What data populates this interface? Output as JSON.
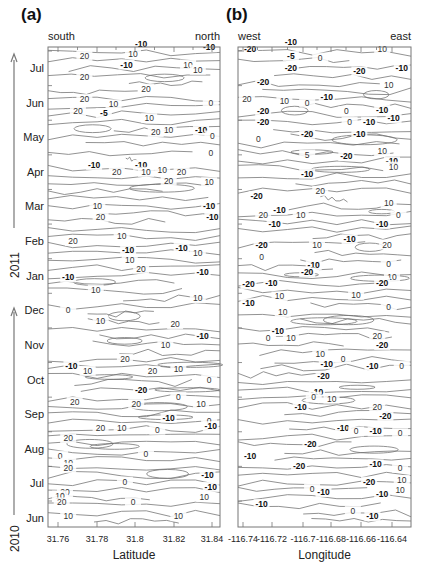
{
  "chart_data": [
    {
      "type": "contour",
      "panel_label": "(a)",
      "title": "",
      "xlabel": "Latitude",
      "ylabel": "",
      "x_direction_labels": {
        "left": "south",
        "right": "north"
      },
      "x_ticks": [
        "31.76",
        "31.78",
        "31.8",
        "31.82",
        "31.84"
      ],
      "xlim": [
        31.755,
        31.845
      ],
      "y_ticks": [
        "Jun",
        "Jul",
        "Aug",
        "Sep",
        "Oct",
        "Nov",
        "Dec",
        "Jan",
        "Feb",
        "Mar",
        "Apr",
        "May",
        "Jun",
        "Jul"
      ],
      "y_year_labels": [
        {
          "year": "2010",
          "months": "Jun–Dec"
        },
        {
          "year": "2011",
          "months": "Jan–Jul"
        }
      ],
      "contour_levels": [
        -20,
        -10,
        -5,
        0,
        5,
        10,
        20
      ],
      "grid": false,
      "contour_labels": [
        {
          "month_pos": 13.7,
          "x": 0.55,
          "v": "-10"
        },
        {
          "month_pos": 13.35,
          "x": 0.2,
          "v": "20"
        },
        {
          "month_pos": 13.4,
          "x": 0.5,
          "v": "10"
        },
        {
          "month_pos": 13.1,
          "x": 0.46,
          "v": "-10"
        },
        {
          "month_pos": 13.1,
          "x": 0.84,
          "v": "10"
        },
        {
          "month_pos": 12.95,
          "x": 0.9,
          "v": "10"
        },
        {
          "month_pos": 13.6,
          "x": 0.97,
          "v": "-10"
        },
        {
          "month_pos": 12.75,
          "x": 0.2,
          "v": "20"
        },
        {
          "month_pos": 12.4,
          "x": 0.58,
          "v": "20"
        },
        {
          "month_pos": 12.1,
          "x": 0.2,
          "v": "20"
        },
        {
          "month_pos": 11.95,
          "x": 0.38,
          "v": "10"
        },
        {
          "month_pos": 12.0,
          "x": 0.98,
          "v": "0"
        },
        {
          "month_pos": 11.75,
          "x": 0.16,
          "v": "20"
        },
        {
          "month_pos": 11.7,
          "x": 0.32,
          "v": "-5"
        },
        {
          "month_pos": 11.55,
          "x": 0.6,
          "v": "10"
        },
        {
          "month_pos": 11.15,
          "x": 0.64,
          "v": "20"
        },
        {
          "month_pos": 11.2,
          "x": 0.72,
          "v": "10"
        },
        {
          "month_pos": 11.2,
          "x": 0.92,
          "v": "-10"
        },
        {
          "month_pos": 11.05,
          "x": 0.99,
          "v": "0"
        },
        {
          "month_pos": 10.55,
          "x": 0.98,
          "v": "0"
        },
        {
          "month_pos": 10.2,
          "x": 0.26,
          "v": "-10"
        },
        {
          "month_pos": 10.2,
          "x": 0.55,
          "v": "-10"
        },
        {
          "month_pos": 10.0,
          "x": 0.4,
          "v": "20"
        },
        {
          "month_pos": 10.0,
          "x": 0.58,
          "v": "10"
        },
        {
          "month_pos": 10.05,
          "x": 0.68,
          "v": "10"
        },
        {
          "month_pos": 10.0,
          "x": 0.8,
          "v": "20"
        },
        {
          "month_pos": 9.75,
          "x": 0.72,
          "v": "20"
        },
        {
          "month_pos": 9.7,
          "x": 0.97,
          "v": "10"
        },
        {
          "month_pos": 9.0,
          "x": 0.28,
          "v": "10"
        },
        {
          "month_pos": 8.7,
          "x": 0.3,
          "v": "20"
        },
        {
          "month_pos": 9.0,
          "x": 0.97,
          "v": "-10"
        },
        {
          "month_pos": 8.7,
          "x": 0.99,
          "v": "-10"
        },
        {
          "month_pos": 8.0,
          "x": 0.13,
          "v": "20"
        },
        {
          "month_pos": 8.15,
          "x": 0.43,
          "v": "10"
        },
        {
          "month_pos": 7.75,
          "x": 0.47,
          "v": "-10"
        },
        {
          "month_pos": 7.8,
          "x": 0.8,
          "v": "-10"
        },
        {
          "month_pos": 7.65,
          "x": 0.9,
          "v": "10"
        },
        {
          "month_pos": 7.45,
          "x": 0.48,
          "v": "10"
        },
        {
          "month_pos": 6.95,
          "x": 0.1,
          "v": "-10"
        },
        {
          "month_pos": 7.2,
          "x": 0.55,
          "v": "20"
        },
        {
          "month_pos": 7.1,
          "x": 0.93,
          "v": "-10"
        },
        {
          "month_pos": 6.6,
          "x": 0.27,
          "v": "10"
        },
        {
          "month_pos": 6.0,
          "x": 0.1,
          "v": "0"
        },
        {
          "month_pos": 6.35,
          "x": 0.9,
          "v": "10"
        },
        {
          "month_pos": 5.7,
          "x": 0.3,
          "v": "10"
        },
        {
          "month_pos": 5.6,
          "x": 0.76,
          "v": "20"
        },
        {
          "month_pos": 5.25,
          "x": 0.93,
          "v": "-10"
        },
        {
          "month_pos": 5.0,
          "x": 0.7,
          "v": "10"
        },
        {
          "month_pos": 4.6,
          "x": 0.45,
          "v": "20"
        },
        {
          "month_pos": 4.4,
          "x": 0.12,
          "v": "-10"
        },
        {
          "month_pos": 4.25,
          "x": 0.22,
          "v": "10"
        },
        {
          "month_pos": 4.25,
          "x": 0.62,
          "v": "20"
        },
        {
          "month_pos": 4.3,
          "x": 0.78,
          "v": "10"
        },
        {
          "month_pos": 4.0,
          "x": 0.97,
          "v": "0"
        },
        {
          "month_pos": 3.7,
          "x": 0.55,
          "v": "-20"
        },
        {
          "month_pos": 3.35,
          "x": 0.14,
          "v": "20"
        },
        {
          "month_pos": 3.3,
          "x": 0.52,
          "v": "20"
        },
        {
          "month_pos": 3.5,
          "x": 0.78,
          "v": "0"
        },
        {
          "month_pos": 3.3,
          "x": 0.92,
          "v": "10"
        },
        {
          "month_pos": 2.9,
          "x": 0.72,
          "v": "-10"
        },
        {
          "month_pos": 2.6,
          "x": 0.3,
          "v": "20"
        },
        {
          "month_pos": 2.6,
          "x": 0.43,
          "v": "10"
        },
        {
          "month_pos": 2.55,
          "x": 0.65,
          "v": "0"
        },
        {
          "month_pos": 2.8,
          "x": 0.97,
          "v": "0"
        },
        {
          "month_pos": 2.65,
          "x": 0.98,
          "v": "-10"
        },
        {
          "month_pos": 2.3,
          "x": 0.1,
          "v": "20"
        },
        {
          "month_pos": 1.8,
          "x": 0.05,
          "v": "0"
        },
        {
          "month_pos": 1.85,
          "x": 0.58,
          "v": "0"
        },
        {
          "month_pos": 1.6,
          "x": 0.1,
          "v": "10"
        },
        {
          "month_pos": 1.45,
          "x": 0.1,
          "v": "20"
        },
        {
          "month_pos": 1.25,
          "x": 0.96,
          "v": "-10"
        },
        {
          "month_pos": 1.05,
          "x": 0.45,
          "v": "0"
        },
        {
          "month_pos": 0.9,
          "x": 0.98,
          "v": "-10"
        },
        {
          "month_pos": 0.75,
          "x": 0.08,
          "v": "20"
        },
        {
          "month_pos": 0.65,
          "x": 0.05,
          "v": "10"
        },
        {
          "month_pos": 0.45,
          "x": 0.06,
          "v": "20"
        },
        {
          "month_pos": 0.45,
          "x": 0.5,
          "v": "0"
        },
        {
          "month_pos": 0.6,
          "x": 0.94,
          "v": "10"
        },
        {
          "month_pos": 0.05,
          "x": 0.1,
          "v": "10"
        },
        {
          "month_pos": 0.05,
          "x": 0.78,
          "v": "10"
        }
      ]
    },
    {
      "type": "contour",
      "panel_label": "(b)",
      "title": "",
      "xlabel": "Longitude",
      "ylabel": "",
      "x_direction_labels": {
        "left": "west",
        "right": "east"
      },
      "x_ticks": [
        "-116.74",
        "-116.72",
        "-116.7",
        "-116.68",
        "-116.66",
        "-116.64"
      ],
      "xlim": [
        -116.745,
        -116.635
      ],
      "y_ticks": [
        "Jun",
        "Jul",
        "Aug",
        "Sep",
        "Oct",
        "Nov",
        "Dec",
        "Jan",
        "Feb",
        "Mar",
        "Apr",
        "May",
        "Jun",
        "Jul"
      ],
      "contour_levels": [
        -20,
        -10,
        -5,
        0,
        5,
        10,
        20
      ],
      "grid": false,
      "contour_labels": [
        {
          "month_pos": 13.75,
          "x": 0.3,
          "v": "-10"
        },
        {
          "month_pos": 13.55,
          "x": 0.05,
          "v": "-20"
        },
        {
          "month_pos": 13.35,
          "x": 0.3,
          "v": "-5"
        },
        {
          "month_pos": 13.3,
          "x": 0.48,
          "v": "0"
        },
        {
          "month_pos": 13.55,
          "x": 0.86,
          "v": "10"
        },
        {
          "month_pos": 13.0,
          "x": 0.3,
          "v": "-20"
        },
        {
          "month_pos": 12.9,
          "x": 0.72,
          "v": "-20"
        },
        {
          "month_pos": 13.0,
          "x": 0.98,
          "v": "-10"
        },
        {
          "month_pos": 12.6,
          "x": 0.13,
          "v": "-20"
        },
        {
          "month_pos": 12.5,
          "x": 0.9,
          "v": "10"
        },
        {
          "month_pos": 12.15,
          "x": 0.52,
          "v": "-10"
        },
        {
          "month_pos": 12.1,
          "x": 0.03,
          "v": "20"
        },
        {
          "month_pos": 12.05,
          "x": 0.26,
          "v": "10"
        },
        {
          "month_pos": 12.0,
          "x": 0.4,
          "v": "0"
        },
        {
          "month_pos": 11.75,
          "x": 0.13,
          "v": "-20"
        },
        {
          "month_pos": 11.75,
          "x": 0.64,
          "v": "0"
        },
        {
          "month_pos": 11.8,
          "x": 0.86,
          "v": "-10"
        },
        {
          "month_pos": 11.55,
          "x": 0.93,
          "v": "-10"
        },
        {
          "month_pos": 11.45,
          "x": 0.13,
          "v": "-20"
        },
        {
          "month_pos": 11.45,
          "x": 0.66,
          "v": "0"
        },
        {
          "month_pos": 11.45,
          "x": 0.78,
          "v": "-10"
        },
        {
          "month_pos": 11.1,
          "x": 0.4,
          "v": "-20"
        },
        {
          "month_pos": 11.1,
          "x": 0.72,
          "v": "-10"
        },
        {
          "month_pos": 10.95,
          "x": 0.1,
          "v": "0"
        },
        {
          "month_pos": 10.5,
          "x": 0.4,
          "v": "5"
        },
        {
          "month_pos": 10.45,
          "x": 0.64,
          "v": "-20"
        },
        {
          "month_pos": 10.6,
          "x": 0.86,
          "v": "10"
        },
        {
          "month_pos": 10.3,
          "x": 0.92,
          "v": "-10"
        },
        {
          "month_pos": 10.15,
          "x": 0.93,
          "v": "10"
        },
        {
          "month_pos": 9.95,
          "x": 0.4,
          "v": "-10"
        },
        {
          "month_pos": 9.45,
          "x": 0.48,
          "v": "20"
        },
        {
          "month_pos": 9.3,
          "x": 0.09,
          "v": "-20"
        },
        {
          "month_pos": 9.1,
          "x": 0.9,
          "v": "10"
        },
        {
          "month_pos": 8.9,
          "x": 0.23,
          "v": "-10"
        },
        {
          "month_pos": 8.75,
          "x": 0.13,
          "v": "20"
        },
        {
          "month_pos": 8.75,
          "x": 0.36,
          "v": "10"
        },
        {
          "month_pos": 8.75,
          "x": 0.96,
          "v": "0"
        },
        {
          "month_pos": 8.5,
          "x": 0.2,
          "v": "-10"
        },
        {
          "month_pos": 8.5,
          "x": 0.86,
          "v": "-10"
        },
        {
          "month_pos": 8.05,
          "x": 0.66,
          "v": "-10"
        },
        {
          "month_pos": 7.9,
          "x": 0.12,
          "v": "-20"
        },
        {
          "month_pos": 7.9,
          "x": 0.46,
          "v": "10"
        },
        {
          "month_pos": 7.9,
          "x": 0.89,
          "v": "20"
        },
        {
          "month_pos": 7.55,
          "x": 0.12,
          "v": "0"
        },
        {
          "month_pos": 7.35,
          "x": 0.9,
          "v": "0"
        },
        {
          "month_pos": 7.3,
          "x": 0.44,
          "v": "-10"
        },
        {
          "month_pos": 7.1,
          "x": 0.4,
          "v": "-20"
        },
        {
          "month_pos": 6.8,
          "x": 0.18,
          "v": "-10"
        },
        {
          "month_pos": 6.75,
          "x": 0.04,
          "v": "-20"
        },
        {
          "month_pos": 6.95,
          "x": 0.92,
          "v": "10"
        },
        {
          "month_pos": 6.8,
          "x": 0.86,
          "v": "-20"
        },
        {
          "month_pos": 6.4,
          "x": 0.23,
          "v": "10"
        },
        {
          "month_pos": 6.45,
          "x": 0.7,
          "v": "10"
        },
        {
          "month_pos": 6.2,
          "x": 0.04,
          "v": "-10"
        },
        {
          "month_pos": 6.1,
          "x": 0.9,
          "v": "0"
        },
        {
          "month_pos": 5.95,
          "x": 0.25,
          "v": "10"
        },
        {
          "month_pos": 5.4,
          "x": 0.22,
          "v": "-10"
        },
        {
          "month_pos": 5.2,
          "x": 0.16,
          "v": "0"
        },
        {
          "month_pos": 5.2,
          "x": 0.3,
          "v": "10"
        },
        {
          "month_pos": 5.25,
          "x": 0.83,
          "v": "20"
        },
        {
          "month_pos": 5.0,
          "x": 0.86,
          "v": "-20"
        },
        {
          "month_pos": 4.75,
          "x": 0.48,
          "v": "10"
        },
        {
          "month_pos": 4.6,
          "x": 0.62,
          "v": "0"
        },
        {
          "month_pos": 4.45,
          "x": 0.52,
          "v": "-10"
        },
        {
          "month_pos": 4.4,
          "x": 0.8,
          "v": "-10"
        },
        {
          "month_pos": 4.4,
          "x": 0.98,
          "v": "0"
        },
        {
          "month_pos": 4.1,
          "x": 0.5,
          "v": "-20"
        },
        {
          "month_pos": 3.65,
          "x": 0.46,
          "v": "-10"
        },
        {
          "month_pos": 3.5,
          "x": 0.44,
          "v": "0"
        },
        {
          "month_pos": 3.45,
          "x": 0.55,
          "v": "10"
        },
        {
          "month_pos": 3.2,
          "x": 0.36,
          "v": "-10"
        },
        {
          "month_pos": 3.2,
          "x": 0.83,
          "v": "20"
        },
        {
          "month_pos": 2.95,
          "x": 0.88,
          "v": "-20"
        },
        {
          "month_pos": 2.6,
          "x": 0.62,
          "v": "-10"
        },
        {
          "month_pos": 2.5,
          "x": 0.7,
          "v": "0"
        },
        {
          "month_pos": 2.5,
          "x": 0.82,
          "v": "-10"
        },
        {
          "month_pos": 2.45,
          "x": 0.97,
          "v": "0"
        },
        {
          "month_pos": 2.15,
          "x": 0.42,
          "v": "-20"
        },
        {
          "month_pos": 1.8,
          "x": 0.05,
          "v": "-10"
        },
        {
          "month_pos": 1.5,
          "x": 0.35,
          "v": "-20"
        },
        {
          "month_pos": 1.55,
          "x": 0.82,
          "v": "-10"
        },
        {
          "month_pos": 1.45,
          "x": 0.97,
          "v": "0"
        },
        {
          "month_pos": 1.05,
          "x": 0.78,
          "v": "-20"
        },
        {
          "month_pos": 1.1,
          "x": 0.98,
          "v": "10"
        },
        {
          "month_pos": 0.85,
          "x": 0.43,
          "v": "0"
        },
        {
          "month_pos": 0.75,
          "x": 0.5,
          "v": "-10"
        },
        {
          "month_pos": 0.7,
          "x": 0.86,
          "v": "-10"
        },
        {
          "month_pos": 0.8,
          "x": 0.97,
          "v": "10"
        },
        {
          "month_pos": 0.4,
          "x": 0.12,
          "v": "-10"
        },
        {
          "month_pos": 0.2,
          "x": 0.68,
          "v": "0"
        },
        {
          "month_pos": 0.05,
          "x": 0.8,
          "v": "-10"
        }
      ]
    }
  ],
  "figure": {
    "panels": [
      {
        "id": "a",
        "label": "(a)",
        "left_dir": "south",
        "right_dir": "north",
        "xlabel": "Latitude",
        "ticks": [
          "31.76",
          "31.78",
          "31.8",
          "31.82",
          "31.84"
        ]
      },
      {
        "id": "b",
        "label": "(b)",
        "left_dir": "west",
        "right_dir": "east",
        "xlabel": "Longitude",
        "ticks": [
          "-116.74",
          "-116.72",
          "-116.7",
          "-116.68",
          "-116.66",
          "-116.64"
        ]
      }
    ],
    "months": [
      "Jun",
      "Jul",
      "Aug",
      "Sep",
      "Oct",
      "Nov",
      "Dec",
      "Jan",
      "Feb",
      "Mar",
      "Apr",
      "May",
      "Jun",
      "Jul"
    ],
    "years": [
      "2010",
      "2011"
    ],
    "colors": {
      "contour": "#6e6e6e",
      "frame": "#777777",
      "text": "#222222"
    }
  }
}
